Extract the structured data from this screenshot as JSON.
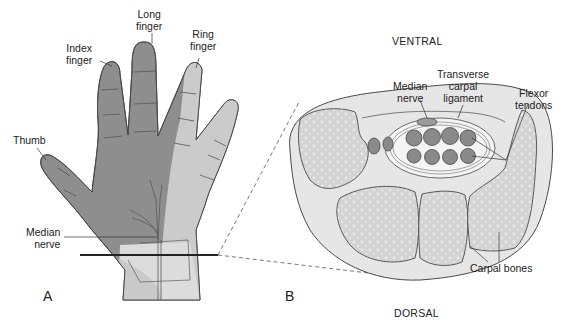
{
  "figure": {
    "panel_a": {
      "letter": "A",
      "labels": {
        "long_finger": [
          "Long",
          "finger"
        ],
        "index_finger": [
          "Index",
          "finger"
        ],
        "ring_finger": [
          "Ring",
          "finger"
        ],
        "thumb": "Thumb",
        "median_nerve": [
          "Median",
          "nerve"
        ]
      }
    },
    "panel_b": {
      "letter": "B",
      "orientation_top": "VENTRAL",
      "orientation_bottom": "DORSAL",
      "labels": {
        "median_nerve": [
          "Median",
          "nerve"
        ],
        "transverse_carpal_ligament": [
          "Transverse",
          "carpal",
          "ligament"
        ],
        "flexor_tendons": [
          "Flexor",
          "tendons"
        ],
        "carpal_bones": "Carpal bones"
      }
    },
    "colors": {
      "hand_dark": "#8e8e8e",
      "hand_light": "#c9c9c9",
      "wrist_light": "#dcdcdc",
      "outline": "#4a4a4a",
      "tendon": "#8a8a8a",
      "bone_fill": "#d6d6d6",
      "tissue_fill": "#e6e6e6"
    }
  }
}
